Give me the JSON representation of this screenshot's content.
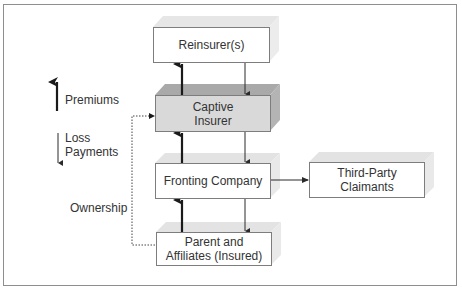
{
  "caption": "Typical Fronting Arrangement",
  "legend": {
    "premiums": "Premiums",
    "loss_payments_line1": "Loss",
    "loss_payments_line2": "Payments",
    "ownership": "Ownership"
  },
  "nodes": {
    "reinsurer": {
      "label": "Reinsurer(s)"
    },
    "captive": {
      "line1": "Captive",
      "line2": "Insurer"
    },
    "fronting": {
      "label": "Fronting Company"
    },
    "third_party": {
      "line1": "Third-Party",
      "line2": "Claimants"
    },
    "parent": {
      "line1": "Parent and",
      "line2": "Affiliates (Insured)"
    }
  },
  "edges": [
    {
      "from": "parent",
      "to": "fronting",
      "type": "premiums"
    },
    {
      "from": "fronting",
      "to": "captive",
      "type": "premiums"
    },
    {
      "from": "captive",
      "to": "reinsurer",
      "type": "premiums"
    },
    {
      "from": "reinsurer",
      "to": "captive",
      "type": "loss_payments"
    },
    {
      "from": "captive",
      "to": "fronting",
      "type": "loss_payments"
    },
    {
      "from": "fronting",
      "to": "parent",
      "type": "loss_payments"
    },
    {
      "from": "fronting",
      "to": "third_party",
      "type": "loss_payments"
    },
    {
      "from": "parent",
      "to": "captive",
      "type": "ownership"
    }
  ],
  "colors": {
    "box_border": "#7d7d7d",
    "box_fill": "#ffffff",
    "captive_fill": "#d9d9d9",
    "shadow_light": "#e3e3e3",
    "shadow_dark": "#a9a9a9",
    "arrow": "#1a1a1a"
  }
}
